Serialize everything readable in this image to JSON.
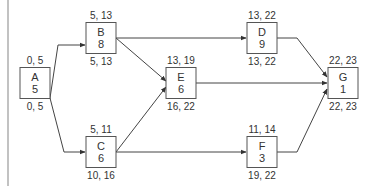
{
  "diagram": {
    "type": "activity-on-node network",
    "nodes": [
      {
        "id": "A",
        "duration": "5",
        "top": "0, 5",
        "bottom": "0, 5",
        "x": 35,
        "y": 83
      },
      {
        "id": "B",
        "duration": "8",
        "top": "5, 13",
        "bottom": "5, 13",
        "x": 101,
        "y": 38
      },
      {
        "id": "C",
        "duration": "6",
        "top": "5, 11",
        "bottom": "10, 16",
        "x": 101,
        "y": 152
      },
      {
        "id": "E",
        "duration": "6",
        "top": "13, 19",
        "bottom": "16, 22",
        "x": 181,
        "y": 83
      },
      {
        "id": "D",
        "duration": "9",
        "top": "13, 22",
        "bottom": "13, 22",
        "x": 262,
        "y": 38
      },
      {
        "id": "F",
        "duration": "3",
        "top": "11, 14",
        "bottom": "19, 22",
        "x": 262,
        "y": 152
      },
      {
        "id": "G",
        "duration": "1",
        "top": "22, 23",
        "bottom": "22, 23",
        "x": 343,
        "y": 83
      }
    ],
    "edges": [
      {
        "from": "A",
        "to": "B"
      },
      {
        "from": "A",
        "to": "C"
      },
      {
        "from": "B",
        "to": "D"
      },
      {
        "from": "B",
        "to": "E"
      },
      {
        "from": "C",
        "to": "E"
      },
      {
        "from": "C",
        "to": "F"
      },
      {
        "from": "D",
        "to": "G"
      },
      {
        "from": "E",
        "to": "G"
      },
      {
        "from": "F",
        "to": "G"
      }
    ]
  }
}
